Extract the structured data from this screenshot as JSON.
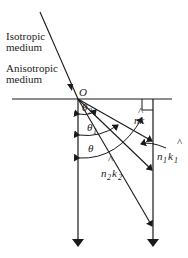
{
  "labels": {
    "isotropic_line1": "Isotropic",
    "isotropic_line2": "medium",
    "anisotropic_line1": "Anisotropic",
    "anisotropic_line2": "medium",
    "origin": "O",
    "theta2": "θ",
    "theta2_sub": "2",
    "theta1": "θ",
    "theta1_sub": "1",
    "theta": "θ",
    "nk": "nk",
    "n1k1_n": "n",
    "n1k1_nsub": "1",
    "n1k1_k": "k",
    "n1k1_ksub": "1",
    "n2k2_n": "n",
    "n2k2_nsub": "2",
    "n2k2_k": "k",
    "n2k2_ksub": "2",
    "hat": "^"
  },
  "colors": {
    "line": "#1a1a1a",
    "background": "#ffffff"
  }
}
